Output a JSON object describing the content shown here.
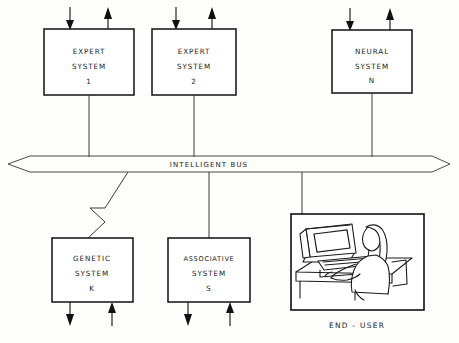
{
  "diagram": {
    "bus": {
      "label": "INTELLIGENT  BUS",
      "name": "intelligent-bus",
      "left_arrow": "left-arrowhead",
      "right_arrow": "right-arrowhead"
    },
    "top_nodes": [
      {
        "id": "expert-system-1",
        "line1": "EXPERT",
        "line2": "SYSTEM",
        "line3": "1",
        "x": 44,
        "y": 29,
        "w": 90,
        "h": 66,
        "in_arrow": "down-arrow-input",
        "out_arrow": "up-arrow-output"
      },
      {
        "id": "expert-system-2",
        "line1": "EXPERT",
        "line2": "SYSTEM",
        "line3": "2",
        "x": 152,
        "y": 29,
        "w": 84,
        "h": 66,
        "in_arrow": "down-arrow-input",
        "out_arrow": "up-arrow-output"
      },
      {
        "id": "neural-system-n",
        "line1": "NEURAL",
        "line2": "SYSTEM",
        "line3": "N",
        "x": 332,
        "y": 30,
        "w": 80,
        "h": 63,
        "in_arrow": "down-arrow-input",
        "out_arrow": "up-arrow-output"
      }
    ],
    "bottom_nodes": [
      {
        "id": "genetic-system-k",
        "line1": "GENETIC",
        "line2": "SYSTEM",
        "line3": "K",
        "x": 52,
        "y": 238,
        "w": 81,
        "h": 64,
        "out_arrow": "down-arrow-output",
        "in_arrow": "up-arrow-input",
        "connector": "zigzag-connector"
      },
      {
        "id": "associative-system-s",
        "line1": "ASSOCIATIVE",
        "line2": "SYSTEM",
        "line3": "S",
        "x": 168,
        "y": 238,
        "w": 82,
        "h": 64,
        "out_arrow": "down-arrow-output",
        "in_arrow": "up-arrow-input",
        "connector": "straight-connector"
      }
    ],
    "end_user": {
      "id": "end-user-panel",
      "label": "END - USER",
      "x": 291,
      "y": 214,
      "w": 133,
      "h": 96,
      "illustration": "person-at-computer-terminal-illustration",
      "parts": [
        "crt-monitor",
        "keyboard",
        "desk",
        "seated-person"
      ]
    }
  }
}
